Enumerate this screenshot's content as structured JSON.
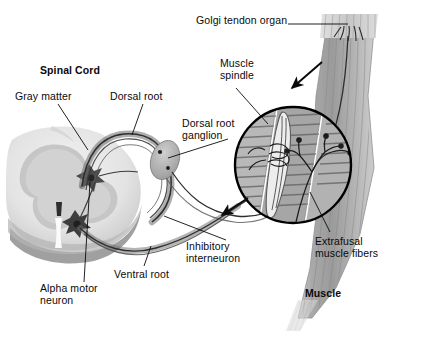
{
  "figure": {
    "title_visible": false,
    "type": "anatomical-diagram",
    "background_color": "#ffffff"
  },
  "labels": [
    {
      "id": "golgi-tendon-organ",
      "text": "Golgi tendon organ",
      "bold": false,
      "x": 196,
      "y": 20,
      "align": "left"
    },
    {
      "id": "spinal-cord",
      "text": "Spinal Cord",
      "bold": true,
      "x": 40,
      "y": 66,
      "align": "left"
    },
    {
      "id": "muscle-spindle",
      "text": "Muscle\nspindle",
      "bold": false,
      "x": 220,
      "y": 60,
      "align": "left"
    },
    {
      "id": "gray-matter",
      "text": "Gray matter",
      "bold": false,
      "x": 17,
      "y": 93,
      "align": "left"
    },
    {
      "id": "dorsal-root",
      "text": "Dorsal root",
      "bold": false,
      "x": 112,
      "y": 93,
      "align": "left"
    },
    {
      "id": "dorsal-root-ganglion",
      "text": "Dorsal root\nganglion",
      "bold": false,
      "x": 183,
      "y": 121,
      "align": "left"
    },
    {
      "id": "extrafusal-muscle-fibers",
      "text": "Extrafusal\nmuscle fibers",
      "bold": false,
      "x": 315,
      "y": 238,
      "align": "left"
    },
    {
      "id": "inhibitory-interneuron",
      "text": "Inhibitory\ninterneuron",
      "bold": false,
      "x": 185,
      "y": 243,
      "align": "left"
    },
    {
      "id": "ventral-root",
      "text": "Ventral root",
      "bold": false,
      "x": 115,
      "y": 271,
      "align": "left"
    },
    {
      "id": "alpha-motor-neuron",
      "text": "Alpha motor\nneuron",
      "bold": false,
      "x": 41,
      "y": 285,
      "align": "left"
    },
    {
      "id": "muscle",
      "text": "Muscle",
      "bold": true,
      "x": 305,
      "y": 290,
      "align": "left"
    }
  ],
  "colors": {
    "ink": "#0a0a0a",
    "white_matter": "#e8e8e8",
    "gray_matter": "#c9c9c9",
    "gray_matter_dark": "#9a9a9a",
    "cord_shadow": "#8d8d8d",
    "nerve_dark": "#3a3a3a",
    "nerve_mid": "#6e6e6e",
    "ganglion": "#b0b0b0",
    "muscle_body": "#a8a8a8",
    "muscle_light": "#c4c4c4",
    "muscle_dark": "#8a8a8a",
    "striation": "#6f6f6f",
    "tendon": "#d2d2d2",
    "circle_outline": "#000000",
    "background": "#ffffff"
  },
  "structures": [
    {
      "id": "spinal-cord-cross-section",
      "description": "Butterfly-shaped gray matter within oval white matter, left side"
    },
    {
      "id": "dorsal-root-fiber",
      "description": "Sensory afferent looping from cord dorsally out to ganglion"
    },
    {
      "id": "dorsal-root-ganglion-body",
      "description": "Oval swelling on the dorsal root"
    },
    {
      "id": "ventral-root-fiber",
      "description": "Motor efferent leaving cord ventrally toward muscle"
    },
    {
      "id": "inhibitory-interneuron-cell",
      "description": "Star-shaped cell body in gray matter"
    },
    {
      "id": "alpha-motor-neuron-cell",
      "description": "Star-shaped cell body in ventral horn"
    },
    {
      "id": "muscle-belly",
      "description": "Tapered striated skeletal muscle on the right"
    },
    {
      "id": "tendon-top",
      "description": "Tendon at top of muscle with Golgi organ nerve endings"
    },
    {
      "id": "magnifier-circle",
      "description": "Black circular inset magnifying spindle and motor end plates"
    },
    {
      "id": "intrafusal-spindle",
      "description": "Encapsulated muscle spindle inside the magnifier"
    },
    {
      "id": "motor-end-plates",
      "description": "Branching axon terminals on extrafusal fibers"
    },
    {
      "id": "arrow-afferent",
      "description": "Arrow indicating conduction direction toward cord, upper"
    },
    {
      "id": "arrow-efferent",
      "description": "Arrow indicating conduction direction, lower"
    }
  ]
}
